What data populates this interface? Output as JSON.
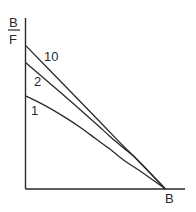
{
  "chart_data": {
    "type": "line",
    "title": "",
    "ylabel_numerator": "B",
    "ylabel_denominator": "F",
    "xlabel": "B",
    "xlim": [
      0,
      1.14
    ],
    "ylim": [
      0,
      1.0
    ],
    "grid": false,
    "legend": "inline curve labels",
    "series": [
      {
        "name": "10",
        "points": [
          [
            0,
            0.84
          ],
          [
            0.25,
            0.63
          ],
          [
            0.5,
            0.42
          ],
          [
            0.7,
            0.25
          ],
          [
            0.8,
            0.17
          ],
          [
            1.0,
            0.0
          ]
        ]
      },
      {
        "name": "2",
        "points": [
          [
            0,
            0.74
          ],
          [
            0.25,
            0.565
          ],
          [
            0.5,
            0.385
          ],
          [
            0.6,
            0.31
          ],
          [
            0.7,
            0.24
          ],
          [
            0.8,
            0.17
          ],
          [
            1.0,
            0.0
          ]
        ]
      },
      {
        "name": "1",
        "points": [
          [
            0,
            0.545
          ],
          [
            0.1,
            0.505
          ],
          [
            0.2,
            0.46
          ],
          [
            0.3,
            0.41
          ],
          [
            0.4,
            0.355
          ],
          [
            0.5,
            0.295
          ],
          [
            0.6,
            0.235
          ],
          [
            0.7,
            0.17
          ],
          [
            0.8,
            0.115
          ],
          [
            0.9,
            0.058
          ],
          [
            1.0,
            0.0
          ]
        ]
      }
    ]
  },
  "colors": {
    "ink": "#2a2a2a"
  }
}
